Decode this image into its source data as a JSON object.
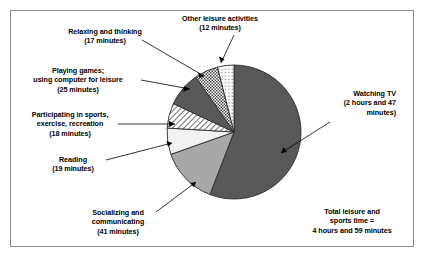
{
  "chart_data": {
    "type": "pie",
    "title": "",
    "units": "minutes",
    "total_label": "Total leisure and sports time =",
    "total_value_text": "4 hours and 59 minutes",
    "total_minutes": 299,
    "legend_position": "callout-labels",
    "categories": [
      "Watching TV",
      "Socializing and communicating",
      "Reading",
      "Participating in sports, exercise, recreation",
      "Playing games; using computer for leisure",
      "Relaxing and thinking",
      "Other leisure activities"
    ],
    "values": [
      167,
      41,
      19,
      18,
      25,
      17,
      12
    ],
    "value_texts": [
      "2 hours and 47 minutes",
      "41 minutes",
      "19 minutes",
      "18 minutes",
      "25 minutes",
      "17 minutes",
      "12 minutes"
    ],
    "slices": [
      {
        "name": "watching-tv",
        "label_line1": "Watching TV",
        "label_line2": "(2 hours and 47",
        "label_line3": "minutes)",
        "value": 167,
        "start_angle": 0,
        "end_angle": 201.1,
        "fill": "#585858",
        "pattern": "solid"
      },
      {
        "name": "socializing-and-communicating",
        "label_line1": "Socializing and",
        "label_line2": "communicating",
        "label_line3": "(41 minutes)",
        "value": 41,
        "start_angle": 201.1,
        "end_angle": 250.5,
        "fill": "#a8a8a8",
        "pattern": "solid"
      },
      {
        "name": "reading",
        "label_line1": "Reading",
        "label_line2": "(19 minutes)",
        "value": 19,
        "start_angle": 250.5,
        "end_angle": 273.4,
        "fill": "#f2f2f2",
        "pattern": "solid"
      },
      {
        "name": "participating-in-sports",
        "label_line1": "Participating in sports,",
        "label_line2": "exercise, recreation",
        "label_line3": "(18 minutes)",
        "value": 18,
        "start_angle": 273.4,
        "end_angle": 295.1,
        "fill": "#ffffff",
        "pattern": "diagonal-hatch"
      },
      {
        "name": "playing-games-computer",
        "label_line1": "Playing games;",
        "label_line2": "using computer for leisure",
        "label_line3": "(25 minutes)",
        "value": 25,
        "start_angle": 295.1,
        "end_angle": 325.2,
        "fill": "#585858",
        "pattern": "solid"
      },
      {
        "name": "relaxing-and-thinking",
        "label_line1": "Relaxing and thinking",
        "label_line2": "(17 minutes)",
        "value": 17,
        "start_angle": 325.2,
        "end_angle": 345.7,
        "fill": "#ffffff",
        "pattern": "checker"
      },
      {
        "name": "other-leisure-activities",
        "label_line1": "Other leisure activities",
        "label_line2": "(12 minutes)",
        "value": 12,
        "start_angle": 345.7,
        "end_angle": 360,
        "fill": "#ffffff",
        "pattern": "dots"
      }
    ],
    "geometry": {
      "center_x": 234,
      "center_y": 132,
      "radius": 67
    }
  },
  "callouts": {
    "relaxing": {
      "line1": "Relaxing and thinking",
      "line2": "(17 minutes)"
    },
    "other_leisure": {
      "line1": "Other leisure activities",
      "line2": "(12 minutes)"
    },
    "playing_games": {
      "line1": "Playing games;",
      "line2": "using computer for leisure",
      "line3": "(25 minutes)"
    },
    "participating_sports": {
      "line1": "Participating in sports,",
      "line2": "exercise, recreation",
      "line3": "(18 minutes)"
    },
    "reading": {
      "line1": "Reading",
      "line2": "(19 minutes)"
    },
    "socializing": {
      "line1": "Socializing and",
      "line2": "communicating",
      "line3": "(41 minutes)"
    },
    "watching_tv": {
      "line1": "Watching TV",
      "line2": "(2 hours and 47",
      "line3": "minutes)"
    },
    "total": {
      "line1": "Total leisure and",
      "line2": "sports time =",
      "line3": "4 hours and 59 minutes"
    }
  }
}
